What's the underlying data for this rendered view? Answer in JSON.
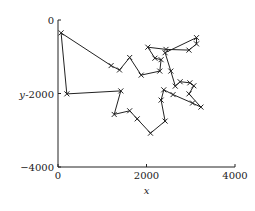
{
  "chart_data": {
    "type": "line",
    "title": "",
    "xlabel": "x",
    "ylabel": "y",
    "xlim": [
      0,
      4000
    ],
    "ylim": [
      -4000,
      0
    ],
    "x_ticks": [
      {
        "value": 0,
        "label": "0"
      },
      {
        "value": 2000,
        "label": "2000"
      },
      {
        "value": 4000,
        "label": "4000"
      }
    ],
    "y_ticks": [
      {
        "value": 0,
        "label": "0"
      },
      {
        "value": -2000,
        "label": "-2000"
      },
      {
        "value": -4000,
        "label": "−4000"
      }
    ],
    "grid": false,
    "legend": null,
    "marker": "x",
    "closed_path": true,
    "series": [
      {
        "name": "tour",
        "points": [
          [
            70,
            -350
          ],
          [
            1200,
            -1240
          ],
          [
            1390,
            -1360
          ],
          [
            1620,
            -1020
          ],
          [
            1880,
            -1500
          ],
          [
            2300,
            -1390
          ],
          [
            2330,
            -1080
          ],
          [
            2190,
            -1040
          ],
          [
            2030,
            -740
          ],
          [
            2440,
            -800
          ],
          [
            2960,
            -820
          ],
          [
            3130,
            -650
          ],
          [
            3130,
            -480
          ],
          [
            2420,
            -890
          ],
          [
            2550,
            -1390
          ],
          [
            2650,
            -1800
          ],
          [
            2760,
            -1680
          ],
          [
            2980,
            -1710
          ],
          [
            3070,
            -1790
          ],
          [
            2960,
            -2010
          ],
          [
            3230,
            -2370
          ],
          [
            3040,
            -2260
          ],
          [
            2600,
            -2030
          ],
          [
            2390,
            -1900
          ],
          [
            2330,
            -2180
          ],
          [
            2420,
            -2750
          ],
          [
            2090,
            -3080
          ],
          [
            1790,
            -2690
          ],
          [
            1620,
            -2470
          ],
          [
            1270,
            -2570
          ],
          [
            1420,
            -1930
          ],
          [
            200,
            -2010
          ]
        ]
      }
    ]
  }
}
